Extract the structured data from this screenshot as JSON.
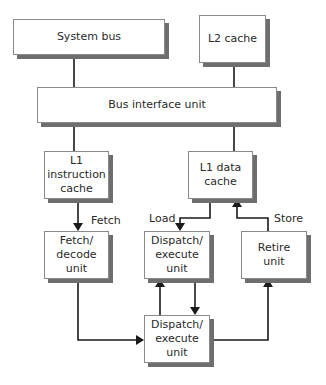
{
  "diagram": {
    "boxes": {
      "system_bus": "System bus",
      "l2_cache": "L2 cache",
      "bus_interface": "Bus interface unit",
      "l1_instruction": "L1 instruction\ncache",
      "l1_data": "L1 data\ncache",
      "fetch_decode": "Fetch/\ndecode unit",
      "dispatch_top": "Dispatch/\nexecute\nunit",
      "retire": "Retire\nunit",
      "dispatch_bottom": "Dispatch/\nexecute\nunit"
    },
    "labels": {
      "fetch": "Fetch",
      "load": "Load",
      "store": "Store"
    },
    "colors": {
      "line": "#1a1a1a",
      "border": "#8a8a8a",
      "shadow": "#6e6e6e"
    }
  }
}
